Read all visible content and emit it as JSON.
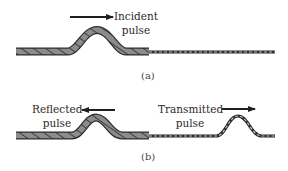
{
  "diagram": {
    "colors": {
      "heavy_rope_fill": "#8c8c8c",
      "rope_outline": "#2b2b2b",
      "light_rope_fill": "#bdbdbd",
      "arrow": "#1f1f1f",
      "text": "#2a2a2a"
    },
    "panels": [
      {
        "id": "a",
        "caption": "(a)",
        "labels": [
          {
            "line1": "Incident",
            "line2": "pulse",
            "arrow_direction": "right"
          }
        ],
        "ropes": [
          {
            "name": "heavy-rope",
            "from_x": 16,
            "to_x": 149,
            "pulse_peak_x": 97
          },
          {
            "name": "light-rope",
            "from_x": 149,
            "to_x": 275
          }
        ]
      },
      {
        "id": "b",
        "caption": "(b)",
        "labels": [
          {
            "line1": "Reflected",
            "line2": "pulse",
            "arrow_direction": "left"
          },
          {
            "line1": "Transmitted",
            "line2": "pulse",
            "arrow_direction": "right"
          }
        ],
        "ropes": [
          {
            "name": "heavy-rope",
            "from_x": 16,
            "to_x": 149,
            "pulse_peak_x": 95
          },
          {
            "name": "light-rope",
            "from_x": 149,
            "to_x": 275,
            "pulse_peak_x": 238
          }
        ]
      }
    ]
  }
}
